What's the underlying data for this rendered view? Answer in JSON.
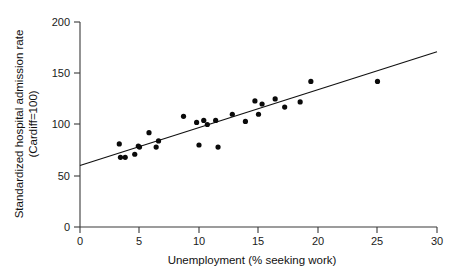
{
  "chart_data": {
    "type": "scatter",
    "title": "",
    "xlabel": "Unemployment (% seeking work)",
    "ylabel": "Standardized hospital admission rate (Cardiff=100)",
    "ylabel_line1": "Standardized hospital admission rate",
    "ylabel_line2": "(Cardiff=100)",
    "xlim": [
      0,
      30
    ],
    "ylim": [
      0,
      200
    ],
    "xticks": [
      0,
      5,
      10,
      15,
      20,
      25,
      30
    ],
    "xtick_labels": [
      "0",
      "5",
      "10",
      "15",
      "20",
      "25",
      "30"
    ],
    "yticks": [
      0,
      50,
      100,
      150,
      200
    ],
    "ytick_labels": [
      "0",
      "50",
      "100",
      "150",
      "200"
    ],
    "grid": false,
    "legend": null,
    "marker": "filled-circle",
    "marker_color": "#0a0a0a",
    "points": [
      {
        "x": 3.3,
        "y": 81
      },
      {
        "x": 3.4,
        "y": 68
      },
      {
        "x": 3.8,
        "y": 68
      },
      {
        "x": 4.6,
        "y": 71
      },
      {
        "x": 4.9,
        "y": 79
      },
      {
        "x": 5.0,
        "y": 78
      },
      {
        "x": 5.8,
        "y": 92
      },
      {
        "x": 6.4,
        "y": 78
      },
      {
        "x": 6.6,
        "y": 84
      },
      {
        "x": 8.7,
        "y": 108
      },
      {
        "x": 9.8,
        "y": 102
      },
      {
        "x": 10.0,
        "y": 80
      },
      {
        "x": 10.4,
        "y": 104
      },
      {
        "x": 10.7,
        "y": 100
      },
      {
        "x": 11.4,
        "y": 104
      },
      {
        "x": 11.6,
        "y": 78
      },
      {
        "x": 12.8,
        "y": 110
      },
      {
        "x": 13.9,
        "y": 103
      },
      {
        "x": 14.7,
        "y": 123
      },
      {
        "x": 15.0,
        "y": 110
      },
      {
        "x": 15.3,
        "y": 120
      },
      {
        "x": 16.4,
        "y": 125
      },
      {
        "x": 17.2,
        "y": 117
      },
      {
        "x": 18.5,
        "y": 122
      },
      {
        "x": 19.4,
        "y": 142
      },
      {
        "x": 25.0,
        "y": 142
      }
    ],
    "fit_line": {
      "name": "regression-line",
      "x_start": 0,
      "y_start": 60,
      "x_end": 30,
      "y_end": 171,
      "color": "#111111"
    }
  }
}
